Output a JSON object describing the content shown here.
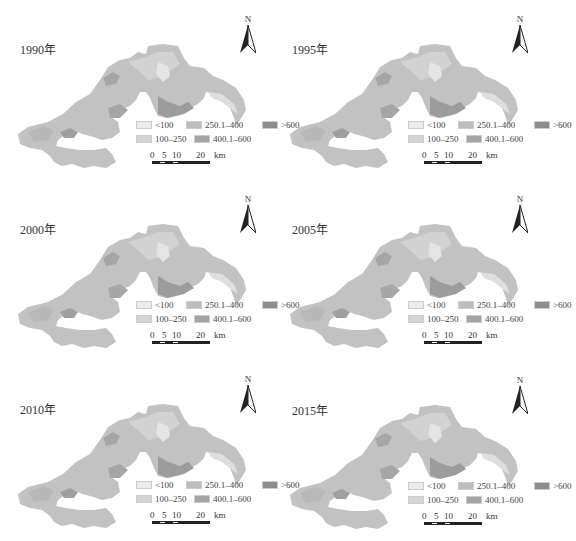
{
  "figure": {
    "type": "multi-panel thematic map series",
    "panels": [
      {
        "year_label": "1990年"
      },
      {
        "year_label": "1995年"
      },
      {
        "year_label": "2000年"
      },
      {
        "year_label": "2005年"
      },
      {
        "year_label": "2010年"
      },
      {
        "year_label": "2015年"
      }
    ],
    "north_arrow_label": "N",
    "legend": {
      "classes": [
        {
          "label": "<100",
          "color": "#ececec"
        },
        {
          "label": "250.1–400",
          "color": "#bdbdbd"
        },
        {
          "label": ">600",
          "color": "#8c8c8c"
        },
        {
          "label": "100–250",
          "color": "#d4d4d4"
        },
        {
          "label": "400.1–600",
          "color": "#a3a3a3"
        }
      ]
    },
    "scale_bar": {
      "ticks": [
        "0",
        "5",
        "10",
        "20"
      ],
      "unit": "km"
    }
  },
  "colors": {
    "background": "#ffffff",
    "region_base": "#c2c2c2",
    "region_light": "#dcdcdc",
    "region_dark": "#979797",
    "text": "#333333"
  }
}
